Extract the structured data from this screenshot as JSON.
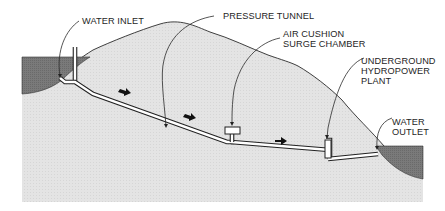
{
  "diagram": {
    "labels": {
      "water_inlet": "WATER INLET",
      "pressure_tunnel": "PRESSURE TUNNEL",
      "air_cushion_line1": "AIR CUSHION",
      "air_cushion_line2": "SURGE CHAMBER",
      "plant_line1": "UNDERGROUND",
      "plant_line2": "HYDROPOWER",
      "plant_line3": "PLANT",
      "outlet_line1": "WATER",
      "outlet_line2": "OUTLET"
    },
    "flow_direction": "left-to-right",
    "flow_arrow_count": 4,
    "colors": {
      "rock": "#e3e3e3",
      "water": "#777777",
      "outline": "#222222",
      "tunnel": "#ffffff",
      "background": "#ffffff"
    }
  }
}
